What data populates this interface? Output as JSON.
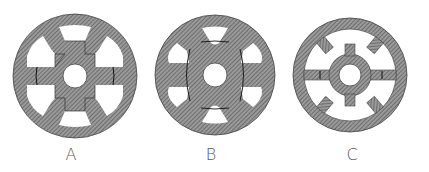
{
  "figure": {
    "colors": {
      "hatch_fill": "#8a8a8a",
      "hatch_line": "#5a5a5a",
      "background": "#ffffff",
      "outline": "#3a3a3a",
      "label": "#555555"
    },
    "panels": [
      {
        "id": "A",
        "label": "A",
        "center": [
          75,
          76
        ],
        "outer_radius": 62,
        "hole_radius": 12
      },
      {
        "id": "B",
        "label": "B",
        "center": [
          215,
          75
        ],
        "outer_radius": 60,
        "hole_radius": 12
      },
      {
        "id": "C",
        "label": "C",
        "center": [
          350,
          75
        ],
        "outer_radius": 57,
        "hole_radius": 11
      }
    ]
  }
}
